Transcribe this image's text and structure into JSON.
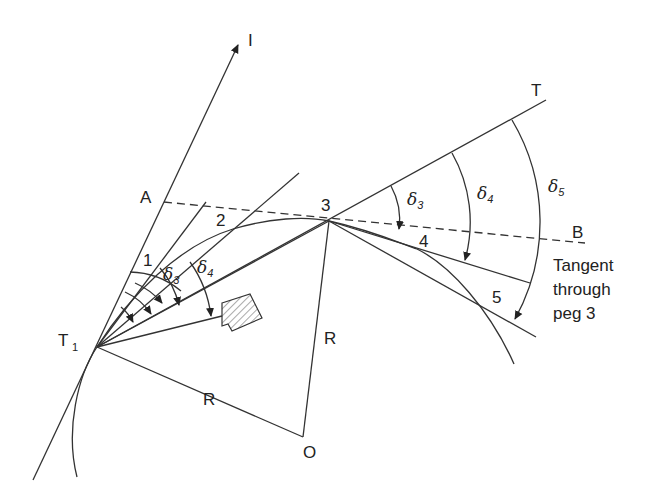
{
  "figure": {
    "points": {
      "I": {
        "label": "I"
      },
      "A": {
        "label": "A"
      },
      "T": {
        "label": "T"
      },
      "B": {
        "label": "B"
      },
      "T1": {
        "label": "T",
        "sub": "1"
      },
      "O": {
        "label": "O"
      },
      "p1": {
        "label": "1"
      },
      "p2": {
        "label": "2"
      },
      "p3": {
        "label": "3"
      },
      "p4": {
        "label": "4"
      },
      "p5": {
        "label": "5"
      }
    },
    "radius_labels": {
      "r_vertical": "R",
      "r_lower": "R"
    },
    "angles": {
      "left_d3": {
        "sym": "δ",
        "sub": "3"
      },
      "left_d4": {
        "sym": "δ",
        "sub": "4"
      },
      "right_d3": {
        "sym": "δ",
        "sub": "3"
      },
      "right_d4": {
        "sym": "δ",
        "sub": "4"
      },
      "right_d5": {
        "sym": "δ",
        "sub": "5"
      }
    },
    "annotation": {
      "line1": "Tangent",
      "line2": "through",
      "line3": "peg 3"
    },
    "colors": {
      "ink": "#333333",
      "background": "#ffffff"
    }
  }
}
